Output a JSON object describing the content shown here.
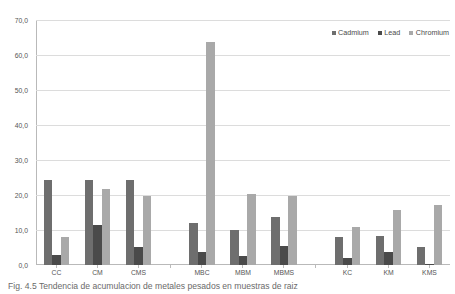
{
  "chart_data": {
    "type": "bar",
    "title": "",
    "xlabel": "",
    "ylabel": "",
    "ylim": [
      0.0,
      70.0
    ],
    "ytick_labels": [
      "70,0",
      "60,0",
      "50,0",
      "40,0",
      "30,0",
      "20,0",
      "10,0",
      "0,0"
    ],
    "ytick_values": [
      70.0,
      60.0,
      50.0,
      40.0,
      30.0,
      20.0,
      10.0,
      0.0
    ],
    "grid": true,
    "legend_position": "top-right",
    "categories": [
      "CC",
      "CM",
      "CMS",
      "MBC",
      "MBM",
      "MBMS",
      "KC",
      "KM",
      "KMS"
    ],
    "series": [
      {
        "name": "Cadmium",
        "color": "#6e6e6e",
        "values": [
          24.4,
          24.2,
          24.4,
          12.0,
          9.9,
          13.6,
          7.9,
          8.3,
          5.2
        ]
      },
      {
        "name": "Lead",
        "color": "#4a4a4a",
        "values": [
          3.0,
          11.5,
          5.1,
          3.7,
          2.5,
          5.4,
          1.9,
          3.8,
          0.4
        ]
      },
      {
        "name": "Chromium",
        "color": "#a9a9a9",
        "values": [
          7.9,
          21.8,
          19.8,
          63.8,
          20.4,
          19.6,
          11.0,
          15.8,
          17.2
        ]
      }
    ],
    "group_separators": [
      3,
      6
    ]
  },
  "legend": {
    "entries": [
      {
        "label": "Cadmium",
        "color": "#6e6e6e"
      },
      {
        "label": "Lead",
        "color": "#4a4a4a"
      },
      {
        "label": "Chromium",
        "color": "#a9a9a9"
      }
    ]
  },
  "caption": {
    "text": "Fig. 4.5 Tendencia de acumulacion de metales pesados en muestras de raiz"
  },
  "colors": {
    "gridline": "#dcdcdc",
    "axis": "#b9b9b9",
    "text": "#555555",
    "background": "#ffffff"
  }
}
